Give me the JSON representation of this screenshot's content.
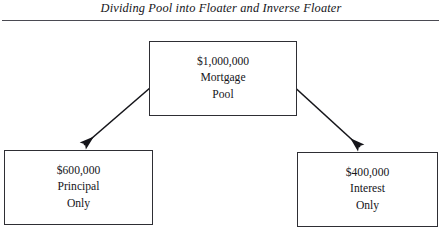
{
  "figure": {
    "title": "Dividing Pool into Floater and Inverse Floater",
    "line_color": "#2e2e34",
    "text_color": "#15151a",
    "background": "#ffffff"
  },
  "nodes": {
    "pool": {
      "amount": "$1,000,000",
      "label_line1": "Mortgage",
      "label_line2": "Pool"
    },
    "principal_only": {
      "amount": "$600,000",
      "label_line1": "Principal",
      "label_line2": "Only"
    },
    "interest_only": {
      "amount": "$400,000",
      "label_line1": "Interest",
      "label_line2": "Only"
    }
  },
  "connectors": [
    {
      "name": "arrow-pool-to-principal",
      "from": "pool",
      "to": "principal_only",
      "direction": "down-left"
    },
    {
      "name": "arrow-pool-to-interest",
      "from": "pool",
      "to": "interest_only",
      "direction": "down-right"
    }
  ]
}
